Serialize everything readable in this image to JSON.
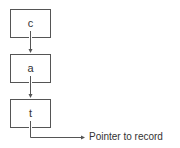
{
  "diagram": {
    "type": "linked-list-trie",
    "nodes": [
      {
        "label": "c"
      },
      {
        "label": "a"
      },
      {
        "label": "t"
      }
    ],
    "edges": [
      {
        "from": "c",
        "to": "a"
      },
      {
        "from": "a",
        "to": "t"
      },
      {
        "from": "t",
        "to": "record-pointer"
      }
    ],
    "terminal_label": "Pointer to record",
    "line_color": "#555555"
  }
}
